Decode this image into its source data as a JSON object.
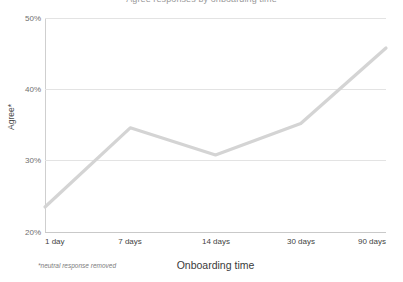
{
  "chart_data": {
    "type": "line",
    "title": "Agree responses by onboarding time",
    "xlabel": "Onboarding time",
    "ylabel": "Agree*",
    "footnote": "*neutral response removed",
    "categories": [
      "1 day",
      "7 days",
      "14 days",
      "30 days",
      "90 days"
    ],
    "values": [
      23.5,
      34.6,
      30.8,
      35.2,
      45.8
    ],
    "series": [
      {
        "name": "Agree*",
        "values": [
          23.5,
          34.6,
          30.8,
          35.2,
          45.8
        ]
      }
    ],
    "ylim": [
      20,
      50
    ],
    "yticks": [
      50,
      40,
      30,
      20
    ],
    "ytick_labels": [
      "50%",
      "40%",
      "30%",
      "20%"
    ],
    "grid": true,
    "legend": "none",
    "line_color": "#d4d4d4",
    "grid_color": "#e3e3e3",
    "axis_color": "#c9c9c9"
  }
}
